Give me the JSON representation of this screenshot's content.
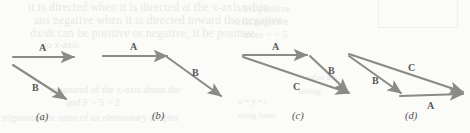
{
  "figure": {
    "name": "vector-addition-panels",
    "background_color": "#fbfbf9",
    "arrow_color": "#8a8a87",
    "label_color": "#585856"
  },
  "bleed_text": {
    "line1": "it is directed when it is directed at the x-axis when",
    "line2": "ans negative when it is directed toward the negative",
    "line3": "dx/dt can be positive or negative, it be positive",
    "line4": "to x-axis.",
    "line5": "measured of the x-axis about the",
    "line6": "and F = 5 = 2",
    "line7": "trigonometric ratio of an elementary chapter",
    "line8": "A is positive",
    "line9": "axis negative",
    "line10": "more = = 5",
    "line11": "value dA",
    "line12": "setting",
    "line13": "x = y = t",
    "line14": "using from"
  },
  "panels": [
    {
      "id": "a",
      "label": "(a)",
      "vectors": [
        {
          "name": "A",
          "label": "A",
          "x1": 13,
          "y1": 57,
          "x2": 74,
          "y2": 57,
          "label_x": 39,
          "label_y": 43
        },
        {
          "name": "B",
          "label": "B",
          "x1": 13,
          "y1": 65,
          "x2": 66,
          "y2": 99,
          "label_x": 32,
          "label_y": 83
        }
      ]
    },
    {
      "id": "b",
      "label": "(b)",
      "vectors": [
        {
          "name": "A",
          "label": "A",
          "x1": 103,
          "y1": 56,
          "x2": 167,
          "y2": 56,
          "label_x": 130,
          "label_y": 42
        },
        {
          "name": "B",
          "label": "B",
          "x1": 167,
          "y1": 57,
          "x2": 221,
          "y2": 96,
          "label_x": 192,
          "label_y": 68
        }
      ]
    },
    {
      "id": "c",
      "label": "(c)",
      "vectors": [
        {
          "name": "A",
          "label": "A",
          "x1": 243,
          "y1": 55,
          "x2": 307,
          "y2": 55,
          "label_x": 272,
          "label_y": 42
        },
        {
          "name": "B",
          "label": "B",
          "x1": 310,
          "y1": 56,
          "x2": 348,
          "y2": 92,
          "label_x": 328,
          "label_y": 66
        },
        {
          "name": "C",
          "label": "C",
          "x1": 243,
          "y1": 57,
          "x2": 349,
          "y2": 93,
          "label_x": 293,
          "label_y": 82
        }
      ]
    },
    {
      "id": "d",
      "label": "(d)",
      "vectors": [
        {
          "name": "C",
          "label": "C",
          "x1": 349,
          "y1": 54,
          "x2": 463,
          "y2": 92,
          "label_x": 408,
          "label_y": 63
        },
        {
          "name": "B",
          "label": "B",
          "x1": 349,
          "y1": 56,
          "x2": 401,
          "y2": 93,
          "label_x": 372,
          "label_y": 76
        },
        {
          "name": "A",
          "label": "A",
          "x1": 400,
          "y1": 96,
          "x2": 463,
          "y2": 94,
          "label_x": 427,
          "label_y": 101
        }
      ]
    }
  ],
  "panel_labels": [
    {
      "id": "a",
      "text": "(a)",
      "x": 36,
      "y": 112
    },
    {
      "id": "b",
      "text": "(b)",
      "x": 152,
      "y": 111
    },
    {
      "id": "c",
      "text": "(c)",
      "x": 292,
      "y": 111
    },
    {
      "id": "d",
      "text": "(d)",
      "x": 405,
      "y": 111
    }
  ]
}
